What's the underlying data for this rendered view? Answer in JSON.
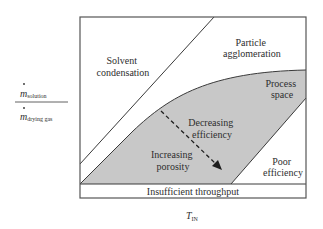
{
  "diagram": {
    "type": "process-space-map",
    "y_axis": {
      "numerator": "m",
      "numerator_sub": "solution",
      "denominator": "m",
      "denominator_sub": "drying gas"
    },
    "x_axis": {
      "label": "T",
      "label_sub": "IN"
    },
    "regions": {
      "solvent_condensation": [
        "Solvent",
        "condensation"
      ],
      "particle_agglomeration": [
        "Particle",
        "agglomeration"
      ],
      "process_space": [
        "Process",
        "space"
      ],
      "decreasing_efficiency": [
        "Decreasing",
        "efficiency"
      ],
      "increasing_porosity": [
        "Increasing",
        "porosity"
      ],
      "poor_efficiency": [
        "Poor",
        "efficiency"
      ],
      "insufficient_throughput": "Insufficient throughput"
    },
    "colors": {
      "process_fill": "#c8c8c8",
      "line": "#3a3a3a",
      "frame": "#555555"
    }
  }
}
